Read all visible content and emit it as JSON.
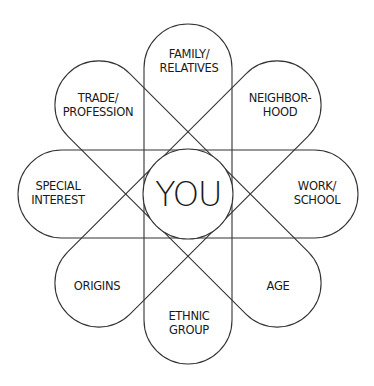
{
  "diagram": {
    "center": {
      "label": "YOU"
    },
    "petals": [
      {
        "id": "family",
        "lines": [
          "FAMILY/",
          "RELATIVES"
        ]
      },
      {
        "id": "neighborhood",
        "lines": [
          "NEIGHBOR-",
          "HOOD"
        ]
      },
      {
        "id": "work",
        "lines": [
          "WORK/",
          "SCHOOL"
        ]
      },
      {
        "id": "age",
        "lines": [
          "AGE"
        ]
      },
      {
        "id": "ethnic",
        "lines": [
          "ETHNIC",
          "GROUP"
        ]
      },
      {
        "id": "origins",
        "lines": [
          "ORIGINS"
        ]
      },
      {
        "id": "special",
        "lines": [
          "SPECIAL",
          "INTEREST"
        ]
      },
      {
        "id": "trade",
        "lines": [
          "TRADE/",
          "PROFESSION"
        ]
      }
    ],
    "colors": {
      "stroke": "#333333",
      "text": "#1a1a1a",
      "background": "#ffffff"
    }
  }
}
